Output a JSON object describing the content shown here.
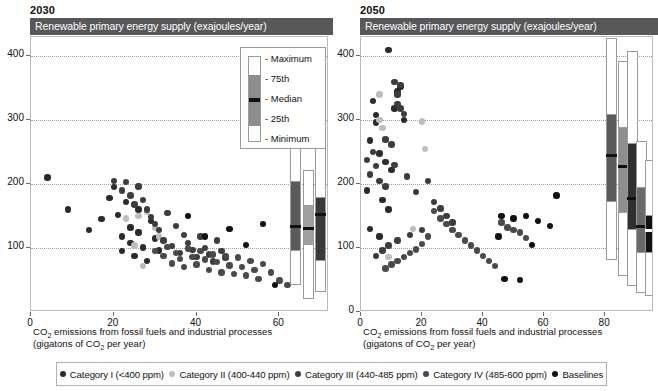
{
  "panels": [
    {
      "year": "2030",
      "title": "Renewable primary energy supply (exajoules/year)",
      "xlabel_line1": "CO2 emissions from fossil fuels and industrial processes",
      "xlabel_line2": "(gigatons of CO2 per year)",
      "xticks": [
        "0",
        "20",
        "40",
        "60"
      ],
      "yticks": [
        "100",
        "200",
        "300",
        "400"
      ]
    },
    {
      "year": "2050",
      "title": "Renewable primary energy supply (exajoules/year)",
      "xlabel_line1": "CO2 emissions from fossil fuels and industrial processes",
      "xlabel_line2": "(gigatons of CO2 per year)",
      "xticks": [
        "0",
        "20",
        "40",
        "60",
        "80"
      ],
      "yticks": [
        "0",
        "100",
        "200",
        "300",
        "400"
      ]
    }
  ],
  "key": {
    "maximum": "- Maximum",
    "p75": "- 75th",
    "median": "- Median",
    "p25": "- 25th",
    "minimum": "- Minimum"
  },
  "legend": [
    {
      "label": "Category I (<400 ppm)",
      "color": "#2b2b2b"
    },
    {
      "label": "Category II (400-440 ppm)",
      "color": "#bdbdbd"
    },
    {
      "label": "Category III (440-485 ppm)",
      "color": "#3d3d3d"
    },
    {
      "label": "Category IV (485-600 ppm)",
      "color": "#4a4a4a"
    },
    {
      "label": "Baselines",
      "color": "#111111"
    }
  ],
  "chart_data": {
    "type": "scatter",
    "xlabel": "CO2 emissions from fossil fuels and industrial processes (gigatons of CO2 per year)",
    "ylabel": "Renewable primary energy supply (exajoules/year)",
    "grid": true,
    "legend_position": "bottom",
    "panels": [
      {
        "name": "2030",
        "xlim": [
          0,
          72
        ],
        "ylim": [
          0,
          430
        ],
        "xticks": [
          0,
          20,
          40,
          60
        ],
        "yticks": [
          100,
          200,
          300,
          400
        ],
        "series": [
          {
            "name": "Category I (<400 ppm)",
            "color": "#2b2b2b",
            "points": [
              [
                4,
                210
              ],
              [
                9,
                160
              ],
              [
                14,
                128
              ],
              [
                17,
                145
              ],
              [
                19,
                178
              ],
              [
                20,
                195
              ],
              [
                21,
                152
              ],
              [
                22,
                118
              ],
              [
                22,
                95
              ],
              [
                23,
                172
              ],
              [
                24,
                132
              ],
              [
                24,
                108
              ],
              [
                25,
                88
              ],
              [
                26,
                160
              ],
              [
                26,
                124
              ],
              [
                27,
                101
              ],
              [
                28,
                80
              ],
              [
                29,
                142
              ],
              [
                30,
                115
              ],
              [
                31,
                96
              ]
            ]
          },
          {
            "name": "Category II (400-440 ppm)",
            "color": "#bdbdbd",
            "points": [
              [
                23,
                146
              ],
              [
                26,
                150
              ],
              [
                28,
                157
              ],
              [
                30,
                131
              ],
              [
                25,
                104
              ],
              [
                31,
                118
              ],
              [
                27,
                72
              ]
            ]
          },
          {
            "name": "Category III (440-485 ppm)",
            "color": "#3d3d3d",
            "points": [
              [
                20,
                205
              ],
              [
                22,
                190
              ],
              [
                23,
                203
              ],
              [
                24,
                182
              ],
              [
                25,
                168
              ],
              [
                26,
                196
              ],
              [
                27,
                175
              ],
              [
                28,
                160
              ],
              [
                29,
                149
              ],
              [
                30,
                138
              ],
              [
                31,
                128
              ],
              [
                32,
                112
              ],
              [
                33,
                155
              ],
              [
                34,
                103
              ],
              [
                35,
                134
              ],
              [
                36,
                92
              ],
              [
                37,
                120
              ],
              [
                38,
                108
              ],
              [
                39,
                97
              ],
              [
                40,
                86
              ],
              [
                41,
                118
              ],
              [
                42,
                100
              ],
              [
                43,
                90
              ],
              [
                44,
                79
              ],
              [
                45,
                112
              ],
              [
                46,
                95
              ],
              [
                47,
                84
              ]
            ]
          },
          {
            "name": "Category IV (485-600 ppm)",
            "color": "#4a4a4a",
            "points": [
              [
                30,
                95
              ],
              [
                32,
                88
              ],
              [
                33,
                102
              ],
              [
                34,
                76
              ],
              [
                35,
                92
              ],
              [
                36,
                83
              ],
              [
                37,
                70
              ],
              [
                38,
                99
              ],
              [
                39,
                86
              ],
              [
                40,
                74
              ],
              [
                41,
                95
              ],
              [
                42,
                82
              ],
              [
                43,
                66
              ],
              [
                44,
                90
              ],
              [
                45,
                78
              ],
              [
                46,
                62
              ],
              [
                47,
                88
              ],
              [
                48,
                73
              ],
              [
                49,
                59
              ],
              [
                50,
                85
              ],
              [
                51,
                70
              ],
              [
                52,
                57
              ],
              [
                53,
                80
              ],
              [
                54,
                66
              ],
              [
                55,
                52
              ],
              [
                56,
                75
              ],
              [
                58,
                62
              ],
              [
                60,
                49
              ],
              [
                62,
                42
              ]
            ]
          },
          {
            "name": "Baselines",
            "color": "#111111",
            "points": [
              [
                38,
                150
              ],
              [
                42,
                118
              ],
              [
                48,
                130
              ],
              [
                52,
                105
              ],
              [
                56,
                138
              ],
              [
                59,
                42
              ],
              [
                64,
                120
              ]
            ]
          }
        ],
        "boxplots": [
          {
            "category": "Category I (<400 ppm)",
            "fill": "#5a5a5a",
            "x": 64,
            "min": 42,
            "p25": 96,
            "median": 134,
            "p75": 205,
            "max": 268
          },
          {
            "category": "Category II (400-440 ppm)",
            "fill": "#a0a0a0",
            "x": 67,
            "min": 20,
            "p25": 104,
            "median": 131,
            "p75": 168,
            "max": 222
          },
          {
            "category": "Category III (440-485 ppm)",
            "fill": "#3a3a3a",
            "x": 70,
            "min": 32,
            "p25": 80,
            "median": 152,
            "p75": 180,
            "max": 272
          },
          {
            "category": "Category IV (485-600 ppm)",
            "fill": "#6a6a6a",
            "x": 73,
            "min": 24,
            "p25": 74,
            "median": 92,
            "p75": 128,
            "max": 158
          },
          {
            "category": "Baselines",
            "fill": "#111111",
            "x": 76,
            "min": 28,
            "p25": 72,
            "median": 88,
            "p75": 104,
            "max": 130
          }
        ]
      },
      {
        "name": "2050",
        "xlim": [
          0,
          96
        ],
        "ylim": [
          0,
          430
        ],
        "xticks": [
          0,
          20,
          40,
          60,
          80
        ],
        "yticks": [
          0,
          100,
          200,
          300,
          400
        ],
        "series": [
          {
            "name": "Category I (<400 ppm)",
            "color": "#2b2b2b",
            "points": [
              [
                9,
                410
              ],
              [
                4,
                330
              ],
              [
                5,
                308
              ],
              [
                5,
                296
              ],
              [
                10,
                222
              ],
              [
                3,
                268
              ],
              [
                6,
                248
              ],
              [
                2,
                190
              ],
              [
                8,
                235
              ],
              [
                12,
                345
              ],
              [
                13,
                352
              ],
              [
                11,
                318
              ],
              [
                7,
                175
              ],
              [
                3,
                130
              ],
              [
                6,
                118
              ],
              [
                9,
                160
              ],
              [
                14,
                300
              ]
            ]
          },
          {
            "name": "Category II (400-440 ppm)",
            "color": "#bdbdbd",
            "points": [
              [
                6,
                340
              ],
              [
                6,
                300
              ],
              [
                7,
                288
              ],
              [
                20,
                298
              ],
              [
                21,
                255
              ],
              [
                17,
                130
              ],
              [
                9,
                86
              ]
            ]
          },
          {
            "name": "Category III (440-485 ppm)",
            "color": "#3d3d3d",
            "points": [
              [
                11,
                360
              ],
              [
                13,
                355
              ],
              [
                12,
                340
              ],
              [
                12,
                325
              ],
              [
                13,
                318
              ],
              [
                14,
                310
              ],
              [
                8,
                270
              ],
              [
                10,
                262
              ],
              [
                4,
                250
              ],
              [
                2,
                238
              ],
              [
                5,
                228
              ],
              [
                3,
                215
              ],
              [
                6,
                205
              ],
              [
                8,
                196
              ],
              [
                11,
                230
              ],
              [
                15,
                212
              ],
              [
                18,
                188
              ],
              [
                22,
                205
              ],
              [
                24,
                172
              ],
              [
                26,
                162
              ],
              [
                28,
                150
              ],
              [
                30,
                140
              ],
              [
                20,
                128
              ],
              [
                16,
                120
              ],
              [
                12,
                112
              ],
              [
                9,
                104
              ],
              [
                7,
                96
              ],
              [
                5,
                88
              ]
            ]
          },
          {
            "name": "Category IV (485-600 ppm)",
            "color": "#4a4a4a",
            "points": [
              [
                24,
                158
              ],
              [
                26,
                146
              ],
              [
                28,
                138
              ],
              [
                30,
                128
              ],
              [
                32,
                120
              ],
              [
                34,
                112
              ],
              [
                22,
                118
              ],
              [
                20,
                106
              ],
              [
                18,
                98
              ],
              [
                16,
                92
              ],
              [
                14,
                86
              ],
              [
                12,
                80
              ],
              [
                10,
                74
              ],
              [
                8,
                68
              ],
              [
                36,
                104
              ],
              [
                38,
                96
              ],
              [
                40,
                88
              ],
              [
                42,
                80
              ],
              [
                44,
                72
              ],
              [
                46,
                140
              ],
              [
                48,
                132
              ],
              [
                50,
                128
              ],
              [
                52,
                124
              ],
              [
                54,
                116
              ]
            ]
          },
          {
            "name": "Baselines",
            "color": "#111111",
            "points": [
              [
                46,
                150
              ],
              [
                50,
                146
              ],
              [
                54,
                150
              ],
              [
                58,
                142
              ],
              [
                62,
                134
              ],
              [
                47,
                52
              ],
              [
                52,
                50
              ],
              [
                64,
                182
              ],
              [
                45,
                118
              ],
              [
                56,
                105
              ]
            ]
          }
        ],
        "boxplots": [
          {
            "category": "Category I (<400 ppm)",
            "fill": "#5a5a5a",
            "x": 82,
            "min": 82,
            "p25": 172,
            "median": 245,
            "p75": 310,
            "max": 428
          },
          {
            "category": "Category II (400-440 ppm)",
            "fill": "#8e8e8e",
            "x": 86,
            "min": 56,
            "p25": 155,
            "median": 228,
            "p75": 290,
            "max": 392
          },
          {
            "category": "Category III (440-485 ppm)",
            "fill": "#2f2f2f",
            "x": 89,
            "min": 40,
            "p25": 128,
            "median": 178,
            "p75": 265,
            "max": 408
          },
          {
            "category": "Category IV (485-600 ppm)",
            "fill": "#6a6a6a",
            "x": 92,
            "min": 30,
            "p25": 92,
            "median": 133,
            "p75": 196,
            "max": 268
          },
          {
            "category": "Baselines",
            "fill": "#111111",
            "x": 95,
            "min": 25,
            "p25": 92,
            "median": 128,
            "p75": 152,
            "max": 238
          }
        ]
      }
    ]
  }
}
